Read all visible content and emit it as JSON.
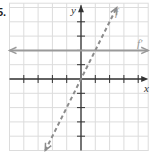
{
  "problem": {
    "number": "5."
  },
  "colors": {
    "grid": "#dcdcdc",
    "axis": "#333333",
    "f_line": "#8c8c8c",
    "fprime_line": "#9a9a9a",
    "label": "#999999",
    "axis_label": "#333333"
  },
  "chart_data": {
    "type": "line",
    "title": "",
    "xlabel": "x",
    "ylabel": "y",
    "xlim": [
      -5,
      4.7
    ],
    "ylim": [
      -5,
      5.3
    ],
    "grid": true,
    "x_ticks": [
      -4,
      -3,
      -2,
      -1,
      1,
      2,
      3,
      4
    ],
    "y_ticks": [
      -4,
      -3,
      -2,
      -1,
      1,
      2,
      3,
      4
    ],
    "tick_labels_shown": false,
    "series": [
      {
        "name": "f",
        "label": "f",
        "style": "dashed",
        "equation": "y = 2x",
        "slope": 2,
        "intercept": 0,
        "points": [
          [
            -2.5,
            -5
          ],
          [
            2.5,
            5
          ]
        ]
      },
      {
        "name": "f'",
        "label": "f′",
        "style": "solid",
        "equation": "y = 2",
        "slope": 0,
        "intercept": 2,
        "points": [
          [
            -5,
            2
          ],
          [
            4.7,
            2
          ]
        ]
      }
    ],
    "legend": "inline labels near line ends"
  },
  "labels": {
    "x_axis": "x",
    "y_axis": "y",
    "f": "f",
    "f_prime": "f′"
  }
}
